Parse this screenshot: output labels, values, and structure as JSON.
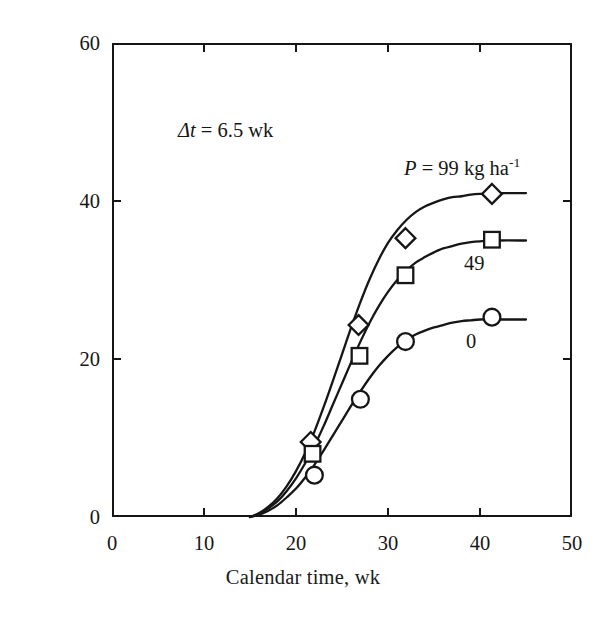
{
  "chart_data": {
    "type": "line",
    "title": "",
    "xlabel": "Calendar time, wk",
    "ylabel": "Plant P uptake, kg ha",
    "ylabel_exponent": "-1",
    "xlim": [
      0,
      50
    ],
    "ylim": [
      0,
      60
    ],
    "xticks": [
      "0",
      "10",
      "20",
      "30",
      "40",
      "50"
    ],
    "xtick_values": [
      0,
      10,
      20,
      30,
      40,
      50
    ],
    "yticks": [
      "0",
      "20",
      "40",
      "60"
    ],
    "ytick_values": [
      0,
      20,
      40,
      60
    ],
    "grid": false,
    "legend": "inline-annotations",
    "annotations": [
      {
        "name": "delta-t",
        "symbol": "Δt",
        "text": " = 6.5 wk"
      },
      {
        "name": "p-99-label",
        "symbol": "P",
        "text": " = 99 kg ha",
        "exponent": "-1"
      },
      {
        "name": "p-49-label",
        "text": "49"
      },
      {
        "name": "p-0-label",
        "text": "0"
      }
    ],
    "series": [
      {
        "name": "P = 99 kg ha^-1",
        "label": "99",
        "marker": "diamond",
        "plateau": 41,
        "points": [
          {
            "x": 21.6,
            "y": 9.5
          },
          {
            "x": 26.8,
            "y": 24.3
          },
          {
            "x": 31.9,
            "y": 35.3
          },
          {
            "x": 41.3,
            "y": 40.9
          }
        ],
        "curve": [
          {
            "x": 15.0,
            "y": 0.0
          },
          {
            "x": 16.0,
            "y": 0.5
          },
          {
            "x": 17.0,
            "y": 1.3
          },
          {
            "x": 18.0,
            "y": 2.4
          },
          {
            "x": 19.0,
            "y": 3.9
          },
          {
            "x": 20.0,
            "y": 5.8
          },
          {
            "x": 21.0,
            "y": 8.1
          },
          {
            "x": 22.0,
            "y": 10.8
          },
          {
            "x": 23.0,
            "y": 13.9
          },
          {
            "x": 24.0,
            "y": 17.2
          },
          {
            "x": 25.0,
            "y": 20.6
          },
          {
            "x": 26.0,
            "y": 24.0
          },
          {
            "x": 27.0,
            "y": 27.2
          },
          {
            "x": 28.0,
            "y": 30.1
          },
          {
            "x": 29.0,
            "y": 32.6
          },
          {
            "x": 30.0,
            "y": 34.7
          },
          {
            "x": 31.0,
            "y": 36.3
          },
          {
            "x": 32.0,
            "y": 37.6
          },
          {
            "x": 33.0,
            "y": 38.6
          },
          {
            "x": 34.0,
            "y": 39.3
          },
          {
            "x": 35.0,
            "y": 39.8
          },
          {
            "x": 36.0,
            "y": 40.2
          },
          {
            "x": 37.0,
            "y": 40.5
          },
          {
            "x": 38.0,
            "y": 40.6
          },
          {
            "x": 39.0,
            "y": 40.8
          },
          {
            "x": 40.0,
            "y": 40.9
          },
          {
            "x": 42.0,
            "y": 41.0
          },
          {
            "x": 45.0,
            "y": 41.0
          }
        ]
      },
      {
        "name": "P = 49 kg ha^-1",
        "label": "49",
        "marker": "square",
        "plateau": 35,
        "points": [
          {
            "x": 21.8,
            "y": 8.0
          },
          {
            "x": 26.9,
            "y": 20.4
          },
          {
            "x": 31.9,
            "y": 30.6
          },
          {
            "x": 41.3,
            "y": 35.1
          }
        ],
        "curve": [
          {
            "x": 15.0,
            "y": 0.0
          },
          {
            "x": 16.0,
            "y": 0.4
          },
          {
            "x": 17.0,
            "y": 1.1
          },
          {
            "x": 18.0,
            "y": 2.0
          },
          {
            "x": 19.0,
            "y": 3.3
          },
          {
            "x": 20.0,
            "y": 4.9
          },
          {
            "x": 21.0,
            "y": 6.8
          },
          {
            "x": 22.0,
            "y": 9.0
          },
          {
            "x": 23.0,
            "y": 11.5
          },
          {
            "x": 24.0,
            "y": 14.2
          },
          {
            "x": 25.0,
            "y": 16.9
          },
          {
            "x": 26.0,
            "y": 19.6
          },
          {
            "x": 27.0,
            "y": 22.2
          },
          {
            "x": 28.0,
            "y": 24.6
          },
          {
            "x": 29.0,
            "y": 26.7
          },
          {
            "x": 30.0,
            "y": 28.5
          },
          {
            "x": 31.0,
            "y": 30.0
          },
          {
            "x": 32.0,
            "y": 31.2
          },
          {
            "x": 33.0,
            "y": 32.2
          },
          {
            "x": 34.0,
            "y": 32.9
          },
          {
            "x": 35.0,
            "y": 33.5
          },
          {
            "x": 36.0,
            "y": 34.0
          },
          {
            "x": 37.0,
            "y": 34.3
          },
          {
            "x": 38.0,
            "y": 34.6
          },
          {
            "x": 39.0,
            "y": 34.8
          },
          {
            "x": 40.0,
            "y": 34.9
          },
          {
            "x": 42.0,
            "y": 35.0
          },
          {
            "x": 45.0,
            "y": 35.0
          }
        ]
      },
      {
        "name": "P = 0 kg ha^-1",
        "label": "0",
        "marker": "circle",
        "plateau": 25,
        "points": [
          {
            "x": 22.0,
            "y": 5.3
          },
          {
            "x": 27.0,
            "y": 14.9
          },
          {
            "x": 31.9,
            "y": 22.2
          },
          {
            "x": 41.3,
            "y": 25.3
          }
        ],
        "curve": [
          {
            "x": 15.0,
            "y": 0.0
          },
          {
            "x": 16.0,
            "y": 0.3
          },
          {
            "x": 17.0,
            "y": 0.8
          },
          {
            "x": 18.0,
            "y": 1.5
          },
          {
            "x": 19.0,
            "y": 2.5
          },
          {
            "x": 20.0,
            "y": 3.6
          },
          {
            "x": 21.0,
            "y": 5.0
          },
          {
            "x": 22.0,
            "y": 6.6
          },
          {
            "x": 23.0,
            "y": 8.4
          },
          {
            "x": 24.0,
            "y": 10.3
          },
          {
            "x": 25.0,
            "y": 12.2
          },
          {
            "x": 26.0,
            "y": 14.1
          },
          {
            "x": 27.0,
            "y": 15.9
          },
          {
            "x": 28.0,
            "y": 17.6
          },
          {
            "x": 29.0,
            "y": 19.1
          },
          {
            "x": 30.0,
            "y": 20.4
          },
          {
            "x": 31.0,
            "y": 21.5
          },
          {
            "x": 32.0,
            "y": 22.4
          },
          {
            "x": 33.0,
            "y": 23.1
          },
          {
            "x": 34.0,
            "y": 23.6
          },
          {
            "x": 35.0,
            "y": 24.0
          },
          {
            "x": 36.0,
            "y": 24.3
          },
          {
            "x": 37.0,
            "y": 24.6
          },
          {
            "x": 38.0,
            "y": 24.8
          },
          {
            "x": 39.0,
            "y": 24.9
          },
          {
            "x": 40.0,
            "y": 25.0
          },
          {
            "x": 42.0,
            "y": 25.0
          },
          {
            "x": 45.0,
            "y": 25.0
          }
        ]
      }
    ],
    "colors": {
      "ink": "#161616",
      "background": "#ffffff"
    }
  }
}
